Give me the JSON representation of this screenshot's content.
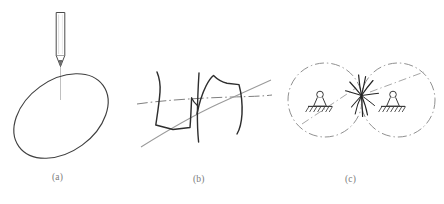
{
  "figure": {
    "background_color": "#ffffff",
    "width": 444,
    "height": 204,
    "ink_color": "#3a3a3a",
    "light_ink_color": "#8c8c8c",
    "caption_color": "#7a7a7a"
  },
  "panels": [
    {
      "id": "a",
      "caption": "(a)",
      "content": "scriber stylus touching top of tilted ellipse",
      "elements": {
        "stylus_barrel": "vertical rectangular pen body",
        "stylus_tip": "conical point",
        "center_line": "vertical light construction line",
        "ellipse": "tilted ellipse outline"
      },
      "ellipse": {
        "cx": 61,
        "cy": 116,
        "rx": 52,
        "ry": 36,
        "rotation_deg": -36
      },
      "stylus": {
        "x": 60,
        "top": 12,
        "bottom": 66,
        "width": 9
      }
    },
    {
      "id": "b",
      "caption": "(b)",
      "content": "overlapping freehand strokes crossing a dash-dot center line",
      "elements": {
        "center_line": "horizontal dash-dot line",
        "diagonal_curve": "light gray sweeping curve",
        "stroke_1": "dark angular U stroke",
        "stroke_2": "dark angular N stroke",
        "stroke_3": "dark vertical stroke"
      }
    },
    {
      "id": "c",
      "caption": "(c)",
      "content": "two tangent dash-dot circles each containing a pin support symbol, with a starburst scribble at the tangent point",
      "circles": [
        {
          "cx": 325,
          "cy": 100,
          "r": 37
        },
        {
          "cx": 398,
          "cy": 100,
          "r": 37
        }
      ],
      "supports": [
        {
          "x": 320,
          "y": 106,
          "type": "pin-support"
        },
        {
          "x": 393,
          "y": 106,
          "type": "pin-support"
        }
      ],
      "scribble": {
        "x": 362,
        "y": 95,
        "type": "starburst"
      }
    }
  ]
}
